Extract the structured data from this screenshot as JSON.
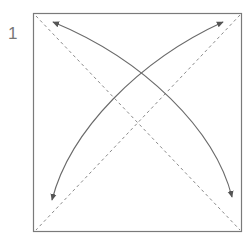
{
  "step": {
    "number": "1"
  },
  "diagram": {
    "colors": {
      "outline": "#7a7a7a",
      "dashed": "#8a8a8a",
      "arrow": "#6a6a6a",
      "background": "#ffffff"
    },
    "square": {
      "x": 33,
      "y": 13,
      "width": 208,
      "height": 218
    },
    "dashed_lines": [
      {
        "name": "diagonal-tl-br",
        "from": [
          36,
          16
        ],
        "to": [
          240,
          230
        ]
      },
      {
        "name": "diagonal-tr-bl",
        "from": [
          240,
          15
        ],
        "to": [
          36,
          230
        ]
      }
    ],
    "arrows": [
      {
        "name": "arrow-bl-to-tr",
        "from": [
          52,
          200
        ],
        "to": [
          223,
          22
        ]
      },
      {
        "name": "arrow-br-to-tl",
        "from": [
          232,
          197
        ],
        "to": [
          53,
          22
        ]
      }
    ]
  }
}
